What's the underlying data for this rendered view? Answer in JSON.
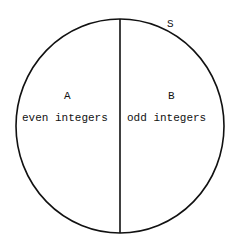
{
  "diagram": {
    "universal_set_label": "S",
    "regions": [
      {
        "name": "A",
        "description": "even integers"
      },
      {
        "name": "B",
        "description": "odd integers"
      }
    ]
  }
}
